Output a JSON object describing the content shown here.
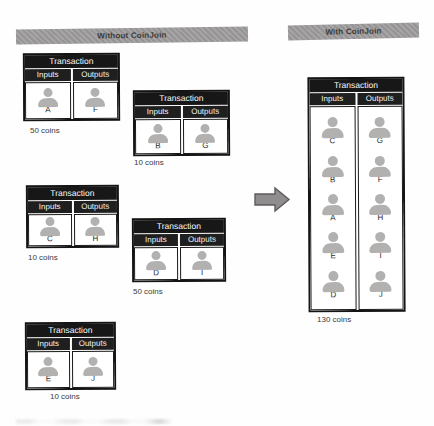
{
  "banners": {
    "without": "Without CoinJoin",
    "with": "With CoinJoin"
  },
  "labels": {
    "transaction": "Transaction",
    "inputs": "Inputs",
    "outputs": "Outputs"
  },
  "transactions": [
    {
      "inputs": [
        "A"
      ],
      "outputs": [
        "F"
      ],
      "coins": "50 coins"
    },
    {
      "inputs": [
        "B"
      ],
      "outputs": [
        "G"
      ],
      "coins": "10 coins"
    },
    {
      "inputs": [
        "C"
      ],
      "outputs": [
        "H"
      ],
      "coins": "10 coins"
    },
    {
      "inputs": [
        "D"
      ],
      "outputs": [
        "I"
      ],
      "coins": "50 coins"
    },
    {
      "inputs": [
        "E"
      ],
      "outputs": [
        "J"
      ],
      "coins": "10 coins"
    }
  ],
  "coinjoin_transaction": {
    "inputs": [
      "C",
      "B",
      "A",
      "E",
      "D"
    ],
    "outputs": [
      "G",
      "F",
      "H",
      "I",
      "J"
    ],
    "coins": "130 coins"
  },
  "colors": {
    "banner_bg": "#9c9a9a",
    "banner_text": "#3b3b3b",
    "header_bg": "#171717",
    "subheader_bg": "#1f1f1f",
    "icon_gray": "#b3b0b0",
    "arrow_fill": "#8f8d8d",
    "arrow_stroke": "#5c5c5c"
  }
}
